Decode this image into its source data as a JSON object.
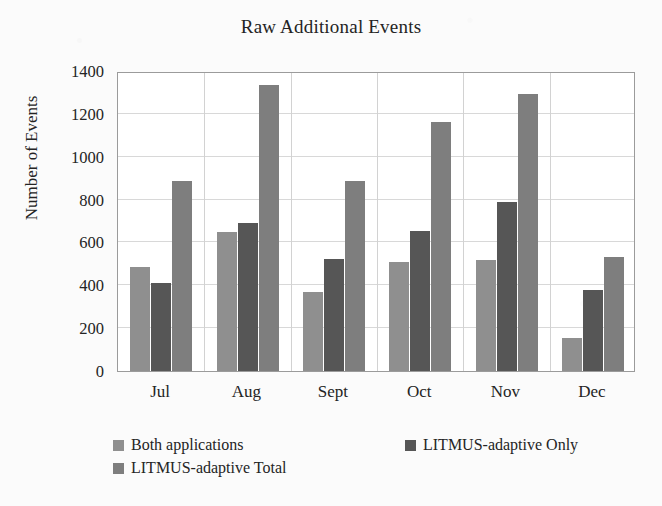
{
  "chart_data": {
    "type": "bar",
    "title": "Raw Additional Events",
    "xlabel": "",
    "ylabel": "Number of Events",
    "categories": [
      "Jul",
      "Aug",
      "Sept",
      "Oct",
      "Nov",
      "Dec"
    ],
    "series": [
      {
        "name": "Both applications",
        "color": "#8f8f8f",
        "values": [
          485,
          650,
          370,
          510,
          520,
          155
        ]
      },
      {
        "name": "LITMUS-adaptive Only",
        "color": "#565656",
        "values": [
          410,
          690,
          525,
          655,
          790,
          380
        ]
      },
      {
        "name": "LITMUS-adaptive Total",
        "color": "#7e7e7e",
        "values": [
          885,
          1335,
          885,
          1160,
          1295,
          530
        ]
      }
    ],
    "ylim": [
      0,
      1400
    ],
    "yticks": [
      "0",
      "200",
      "400",
      "600",
      "800",
      "1000",
      "1200",
      "1400"
    ],
    "ytick_values": [
      0,
      200,
      400,
      600,
      800,
      1000,
      1200,
      1400
    ],
    "grid": "horizontal-and-category-separators",
    "legend_position": "bottom-left",
    "legend": [
      {
        "label": "Both applications",
        "color": "#8f8f8f"
      },
      {
        "label": "LITMUS-adaptive Only",
        "color": "#565656"
      },
      {
        "label": "LITMUS-adaptive Total",
        "color": "#7e7e7e"
      }
    ]
  },
  "figure": {
    "background_color": "#fbfbfb",
    "plot_background_color": "#ffffff",
    "frame_color": "#9b9b9b",
    "gridline_color": "#d8d8d8"
  }
}
